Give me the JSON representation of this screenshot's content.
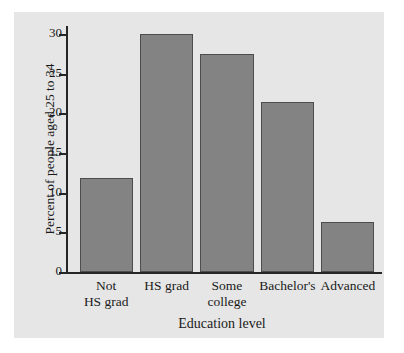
{
  "chart_data": {
    "type": "bar",
    "title": "",
    "xlabel": "Education level",
    "ylabel": "Percent of people aged 25 to 34",
    "categories": [
      "Not\nHS grad",
      "HS grad",
      "Some\ncollege",
      "Bachelor's",
      "Advanced"
    ],
    "category_labels": [
      {
        "line1": "Not",
        "line2": "HS grad"
      },
      {
        "line1": "HS grad",
        "line2": ""
      },
      {
        "line1": "Some",
        "line2": "college"
      },
      {
        "line1": "Bachelor's",
        "line2": ""
      },
      {
        "line1": "Advanced",
        "line2": ""
      }
    ],
    "values": [
      11.8,
      30.0,
      27.5,
      21.4,
      6.3
    ],
    "ylim": [
      0,
      31
    ],
    "xlim_note": "categorical",
    "yticks": [
      0,
      5,
      10,
      15,
      20,
      25,
      30
    ],
    "ytick_labels": [
      "0",
      "5",
      "10",
      "15",
      "20",
      "25",
      "30"
    ],
    "grid": false,
    "legend": false,
    "legend_position": "none",
    "colors": {
      "bar_fill": "#838383",
      "bar_edge": "#4d4d4d",
      "panel_background": "#e6e6e6",
      "figure_background": "#ffffff",
      "axis": "#262626",
      "text": "#1a1a1a"
    }
  }
}
